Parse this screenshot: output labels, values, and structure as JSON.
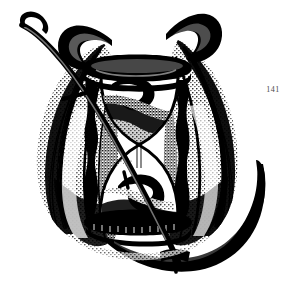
{
  "page": {
    "background_color": "#ffffff",
    "ink_color": "#000000",
    "width": 293,
    "height": 291
  },
  "folio": {
    "label": "141",
    "color": "#4a4a4a"
  },
  "illustration": {
    "title": "Winged hourglass with scythe",
    "subject": "memento mori emblem",
    "style": "black and white engraving / woodcut vignette",
    "medium_tone": "halftone stipple shading",
    "parts": [
      {
        "name": "left-wing",
        "label": "Left feathered wing",
        "description": "Large upswept wing with long barbed feathers, tip curving up and to the left"
      },
      {
        "name": "right-wing",
        "label": "Right feathered wing",
        "description": "Large upswept wing with long barbed feathers, tip hooking up and to the right"
      },
      {
        "name": "hourglass",
        "label": "Hourglass",
        "description": "Central sandglass in a turned wooden frame, upper bulb partly filled with sand"
      },
      {
        "name": "hourglass-top-plate",
        "label": "Top plate",
        "description": "Heavy moulded cap board of the hourglass frame"
      },
      {
        "name": "hourglass-base-plate",
        "label": "Base plate",
        "description": "Heavy moulded base board of the hourglass frame"
      },
      {
        "name": "hourglass-posts",
        "label": "Turned posts",
        "description": "Two baluster-turned columns joining the cap and base"
      },
      {
        "name": "sand",
        "label": "Sand",
        "description": "Dark mass of sand in the upper bulb falling through the waist"
      },
      {
        "name": "scythe",
        "label": "Scythe",
        "description": "Scythe laid diagonally across the emblem, snaith running from upper left to lower right"
      },
      {
        "name": "scythe-snaith",
        "label": "Scythe handle",
        "description": "Long slender curved shaft with a hooked grip at the upper left"
      },
      {
        "name": "scythe-blade",
        "label": "Scythe blade",
        "description": "Broad crescent blade sweeping down the right side of the vignette"
      }
    ]
  }
}
